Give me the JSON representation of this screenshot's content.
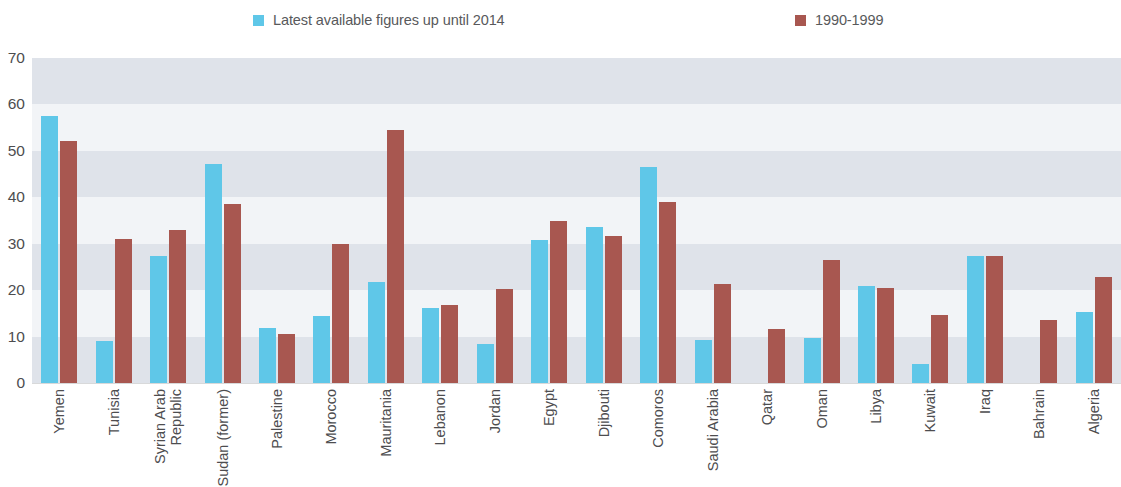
{
  "legend": {
    "entries": [
      {
        "label": "Latest available figures up until 2014",
        "color": "#5fc7e8",
        "icon": "legend-swatch-blue"
      },
      {
        "label": "1990-1999",
        "color": "#a85750",
        "icon": "legend-swatch-red"
      }
    ]
  },
  "axis": {
    "y_ticks": [
      "70",
      "60",
      "50",
      "40",
      "30",
      "20",
      "10",
      "0"
    ]
  },
  "chart_data": {
    "type": "bar",
    "title": "",
    "xlabel": "",
    "ylabel": "",
    "ylim": [
      0,
      70
    ],
    "ytick_step": 10,
    "grid": "horizontal alternating shaded bands every 10 units",
    "legend_position": "top-center",
    "orientation": "vertical grouped",
    "categories": [
      "Yemen",
      "Tunisia",
      "Syrian Arab Republic",
      "Sudan (former)",
      "Palestine",
      "Morocco",
      "Mauritania",
      "Lebanon",
      "Jordan",
      "Egypt",
      "Djibouti",
      "Comoros",
      "Saudi Arabia",
      "Qatar",
      "Oman",
      "Libya",
      "Kuwait",
      "Iraq",
      "Bahrain",
      "Algeria"
    ],
    "category_lines": [
      [
        "Yemen"
      ],
      [
        "Tunisia"
      ],
      [
        "Syrian Arab",
        "Republic"
      ],
      [
        "Sudan (former)"
      ],
      [
        "Palestine"
      ],
      [
        "Morocco"
      ],
      [
        "Mauritania"
      ],
      [
        "Lebanon"
      ],
      [
        "Jordan"
      ],
      [
        "Egypt"
      ],
      [
        "Djibouti"
      ],
      [
        "Comoros"
      ],
      [
        "Saudi Arabia"
      ],
      [
        "Qatar"
      ],
      [
        "Oman"
      ],
      [
        "Libya"
      ],
      [
        "Kuwait"
      ],
      [
        "Iraq"
      ],
      [
        "Bahrain"
      ],
      [
        "Algeria"
      ]
    ],
    "series": [
      {
        "name": "Latest available figures up until 2014",
        "color": "#5fc7e8",
        "values": [
          57.5,
          9.0,
          27.4,
          47.2,
          11.8,
          14.5,
          21.7,
          16.1,
          8.3,
          30.8,
          33.5,
          46.5,
          9.2,
          null,
          9.8,
          20.8,
          4.0,
          27.3,
          null,
          15.3
        ]
      },
      {
        "name": "1990-1999",
        "color": "#a85750",
        "values": [
          52.1,
          31.0,
          33.0,
          38.5,
          10.6,
          30.0,
          54.5,
          16.9,
          20.3,
          34.8,
          31.7,
          39.0,
          21.3,
          11.6,
          26.5,
          20.5,
          14.6,
          27.4,
          13.5,
          22.8
        ]
      }
    ]
  },
  "colors": {
    "series_blue": "#5fc7e8",
    "series_red": "#a85750",
    "band_light": "#f2f4f7",
    "band_dark": "#dfe3ea",
    "text": "#4d4d4f",
    "background": "#ffffff"
  }
}
